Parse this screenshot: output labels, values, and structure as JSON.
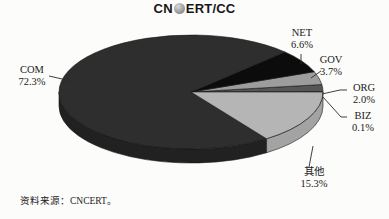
{
  "title": {
    "prefix": "CN",
    "suffix": "ERT/CC",
    "full": "CNCERT/CC",
    "globe_icon": "globe"
  },
  "source_note": "资料来源：CNCERT。",
  "chart_data": {
    "type": "pie",
    "is_3d": true,
    "legend_position": "none",
    "label_style": "callout",
    "slices": [
      {
        "label": "COM",
        "value": 72.3,
        "display": "72.3%",
        "color": "#2e2e2e",
        "side_color": "#212121"
      },
      {
        "label": "NET",
        "value": 6.6,
        "display": "6.6%",
        "color": "#0c0c0c",
        "side_color": "#000000"
      },
      {
        "label": "GOV",
        "value": 3.7,
        "display": "3.7%",
        "color": "#9d9d9d",
        "side_color": "#8b8b8b"
      },
      {
        "label": "ORG",
        "value": 2.0,
        "display": "2.0%",
        "color": "#565656",
        "side_color": "#474747"
      },
      {
        "label": "BIZ",
        "value": 0.1,
        "display": "0.1%",
        "color": "#e9e9e9",
        "side_color": "#cfcfcf"
      },
      {
        "label": "其他",
        "value": 15.3,
        "display": "15.3%",
        "color": "#b5b5b5",
        "side_color": "#a3a3a3"
      }
    ],
    "source": "资料来源：CNCERT。"
  }
}
